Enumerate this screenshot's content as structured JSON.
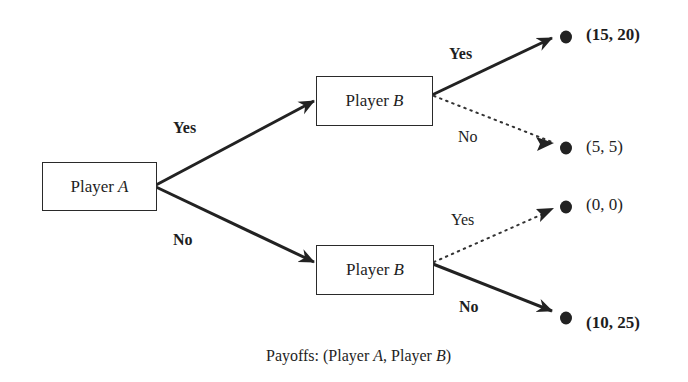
{
  "diagram": {
    "type": "game-tree",
    "nodes": {
      "root": {
        "player": "Player",
        "var": "A"
      },
      "b_top": {
        "player": "Player",
        "var": "B"
      },
      "b_bottom": {
        "player": "Player",
        "var": "B"
      }
    },
    "edges": {
      "a_yes": {
        "label": "Yes",
        "style": "solid-bold"
      },
      "a_no": {
        "label": "No",
        "style": "solid-bold"
      },
      "b_top_yes": {
        "label": "Yes",
        "style": "solid-bold"
      },
      "b_top_no": {
        "label": "No",
        "style": "dotted"
      },
      "b_bottom_yes": {
        "label": "Yes",
        "style": "dotted"
      },
      "b_bottom_no": {
        "label": "No",
        "style": "solid-bold"
      }
    },
    "payoffs": {
      "yes_yes": {
        "text": "(15, 20)",
        "emphasis": true
      },
      "yes_no": {
        "text": "(5, 5)",
        "emphasis": false
      },
      "no_yes": {
        "text": "(0, 0)",
        "emphasis": false
      },
      "no_no": {
        "text": "(10, 25)",
        "emphasis": true
      }
    },
    "caption": {
      "prefix": "Payoffs: (Player ",
      "a": "A",
      "mid": ", Player ",
      "b": "B",
      "suffix": ")"
    }
  }
}
